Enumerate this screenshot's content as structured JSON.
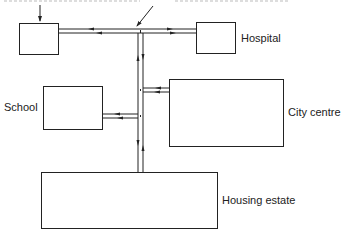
{
  "diagram": {
    "type": "road-network-flow",
    "nodes": [
      {
        "id": "unlabeled-box",
        "label": ""
      },
      {
        "id": "hospital",
        "label": "Hospital"
      },
      {
        "id": "school",
        "label": "School"
      },
      {
        "id": "city-centre",
        "label": "City centre"
      },
      {
        "id": "housing-estate",
        "label": "Housing estate"
      }
    ],
    "edges": [
      {
        "from": "unlabeled-box",
        "to": "junction-top",
        "style": "two-way road"
      },
      {
        "from": "junction-top",
        "to": "hospital",
        "style": "two-way road"
      },
      {
        "from": "junction-top",
        "to": "housing-estate",
        "style": "two-way road (vertical trunk)"
      },
      {
        "from": "trunk",
        "to": "school",
        "style": "two-way road"
      },
      {
        "from": "trunk",
        "to": "city-centre",
        "style": "two-way road"
      }
    ],
    "annotations": [
      {
        "text": "(truncated caption above, pointer to unlabeled box)",
        "target": "unlabeled-box"
      },
      {
        "text": "(truncated caption above, pointer to top junction)",
        "target": "junction-top"
      }
    ]
  },
  "labels": {
    "hospital": "Hospital",
    "school": "School",
    "city_centre": "City centre",
    "housing_estate": "Housing estate"
  },
  "colors": {
    "line": "#222222",
    "background": "#ffffff"
  }
}
